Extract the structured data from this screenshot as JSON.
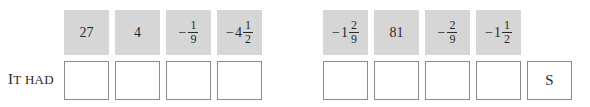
{
  "row_label": {
    "first": "I",
    "rest_first": "T",
    "second": "HAD"
  },
  "top_row": [
    {
      "sign": "",
      "whole": "27",
      "num": "",
      "den": ""
    },
    {
      "sign": "",
      "whole": "4",
      "num": "",
      "den": ""
    },
    {
      "sign": "−",
      "whole": "",
      "num": "1",
      "den": "9"
    },
    {
      "sign": "−",
      "whole": "4",
      "num": "1",
      "den": "2"
    },
    {
      "sign": "−",
      "whole": "1",
      "num": "2",
      "den": "9"
    },
    {
      "sign": "",
      "whole": "81",
      "num": "",
      "den": ""
    },
    {
      "sign": "−",
      "whole": "",
      "num": "2",
      "den": "9"
    },
    {
      "sign": "−",
      "whole": "1",
      "num": "1",
      "den": "2"
    }
  ],
  "bottom_row": [
    "",
    "",
    "",
    "",
    "",
    "",
    "",
    "",
    "S"
  ]
}
